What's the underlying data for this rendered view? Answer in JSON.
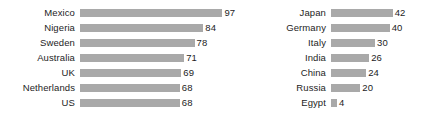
{
  "chart_data": {
    "type": "bar",
    "orientation": "horizontal",
    "title": "",
    "subtitle": "",
    "xlabel": "",
    "ylabel": "",
    "grid": false,
    "legend": "none",
    "axis_visible": false,
    "value_labels_shown": true,
    "bar_color": "#a9a9a9",
    "text_color": "#1d1d1d",
    "background_color": "#ffffff",
    "xlim": [
      0,
      97
    ],
    "panels": [
      {
        "name": "left-panel",
        "categories": [
          "Mexico",
          "Nigeria",
          "Sweden",
          "Australia",
          "UK",
          "Netherlands",
          "US"
        ],
        "values": [
          97,
          84,
          78,
          71,
          69,
          68,
          68
        ]
      },
      {
        "name": "right-panel",
        "categories": [
          "Japan",
          "Germany",
          "Italy",
          "India",
          "China",
          "Russia",
          "Egypt"
        ],
        "values": [
          42,
          40,
          30,
          26,
          24,
          20,
          4
        ]
      }
    ],
    "categories": [
      "Mexico",
      "Nigeria",
      "Sweden",
      "Australia",
      "UK",
      "Netherlands",
      "US",
      "Japan",
      "Germany",
      "Italy",
      "India",
      "China",
      "Russia",
      "Egypt"
    ],
    "values": [
      97,
      84,
      78,
      71,
      69,
      68,
      68,
      42,
      40,
      30,
      26,
      24,
      20,
      4
    ]
  }
}
